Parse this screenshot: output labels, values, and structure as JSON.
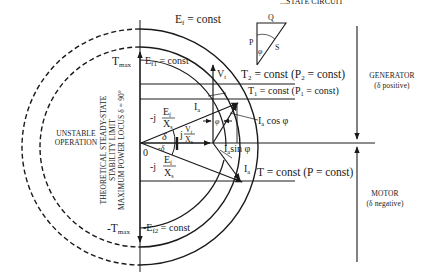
{
  "diagram": {
    "header_fragment": "...STATE CIRCUIT",
    "labels": {
      "ef_const": "E",
      "ef_sub": "f",
      "ef_rest": " = const",
      "ef1_const": "E",
      "ef1_sub": "f1",
      "ef1_rest": " = const",
      "ef2_const": "-E",
      "ef2_sub": "f2",
      "ef2_rest": " = const",
      "tmax": "T",
      "tmax_sub": "max",
      "neg_tmax": "-T",
      "neg_tmax_sub": "max",
      "t2": "T",
      "t2_sub": "2",
      "t2_rest": " = const (P",
      "t2_sub2": "2",
      "t2_end": " = const)",
      "t1": "T",
      "t1_sub": "1",
      "t1_rest": " = const (P",
      "t1_sub2": "1",
      "t1_end": " = const)",
      "t": "T = const (P = const)",
      "vt": "V",
      "vt_sub": "t",
      "ia_top": "I",
      "ia_top_sub": "a",
      "ia_bottom": "I",
      "ia_bottom_sub": "a",
      "ia_cos": "I",
      "ia_cos_sub": "a",
      "ia_cos_rest": " cos φ",
      "ia_sin": "I",
      "ia_sin_sub": "a",
      "ia_sin_rest": "sin φ",
      "phi": "φ",
      "origin": "0",
      "delta": "δ",
      "neg_delta": "-δ",
      "j_ef_xs_top_prefix": "-j",
      "j_ef_xs_num": "E",
      "j_ef_xs_num_sub": "f",
      "j_ef_xs_den": "X",
      "j_ef_xs_den_sub": "s",
      "j_vt_xs_prefix": "j",
      "j_vt_xs_num": "V",
      "j_vt_xs_num_sub": "t",
      "j_vt_xs_den": "X",
      "j_vt_xs_den_sub": "s",
      "j_ef_xs_bot_prefix": "-j"
    },
    "stability_limit": {
      "line1": "THEORETICAL STEADY-STATE",
      "line2": "STABILITY LIMIT",
      "line3": "MAXIMUM POWER LOCUS δ = 90°"
    },
    "unstable": {
      "line1": "UNSTABLE",
      "line2": "OPERATION"
    },
    "generator": {
      "line1": "GENERATOR",
      "line2": "(δ positive)"
    },
    "motor": {
      "line1": "MOTOR",
      "line2": "(δ negative)"
    },
    "power_triangle": {
      "q": "Q",
      "p": "P",
      "s": "S",
      "phi": "φ"
    }
  }
}
